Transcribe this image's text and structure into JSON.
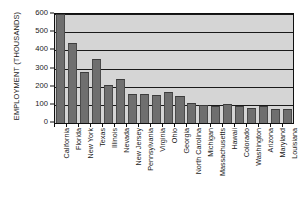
{
  "chart_data": {
    "type": "bar",
    "title": "",
    "xlabel": "",
    "ylabel": "EMPLOYMENT (THOUSANDS)",
    "ylim": [
      0,
      600
    ],
    "yticks": [
      600,
      500,
      400,
      300,
      200,
      100,
      0
    ],
    "grid": true,
    "legend": null,
    "categories": [
      "California",
      "Florida",
      "New York",
      "Texas",
      "Illinois",
      "Nevada",
      "New Jersey",
      "Pennsylvania",
      "Virginia",
      "Ohio",
      "Georgia",
      "North Carolina",
      "Michigan",
      "Massachusetts",
      "Hawaii",
      "Colorado",
      "Washington",
      "Arizona",
      "Maryland",
      "Louisiana"
    ],
    "values": [
      600,
      440,
      280,
      350,
      210,
      240,
      160,
      160,
      155,
      170,
      150,
      110,
      100,
      95,
      105,
      95,
      80,
      95,
      75,
      78
    ],
    "bar_color": "#6f6f6f",
    "plot_background": "#d5d5d5",
    "axis_color": "#111111"
  }
}
